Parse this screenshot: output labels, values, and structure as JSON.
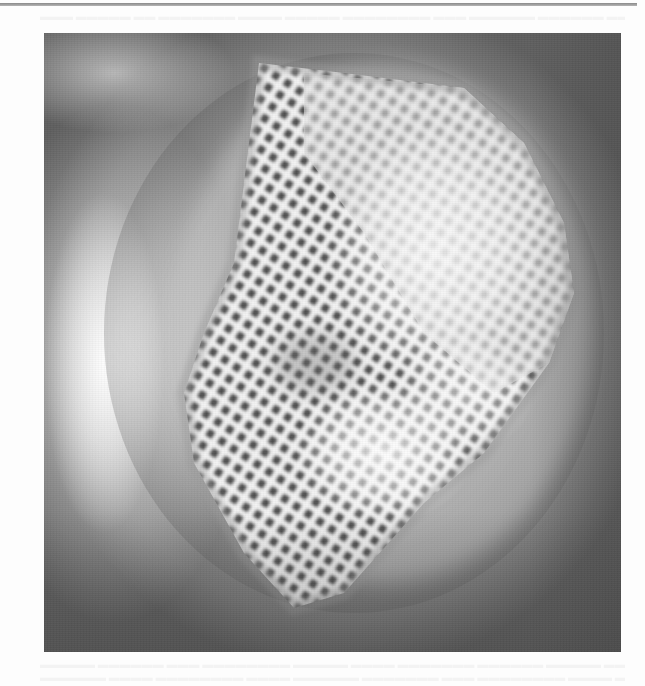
{
  "page": {
    "type": "scanned-document-page",
    "header_rule": true,
    "bleed_through_text": {
      "top_legible": false,
      "bottom_legible": false
    }
  },
  "figure": {
    "kind": "grayscale-photograph",
    "colors": {
      "background_gray": "#8a8a8a",
      "highlight": "#f4f4f4",
      "mesh_strand": "#f2f2f2",
      "mesh_hole": "#4a4a4a",
      "vignette_dark": "#5e5e5e"
    },
    "mesh": {
      "rotation_deg": 33,
      "cell_pitch_px": 14,
      "shape": "diamond patch"
    },
    "caption": ""
  }
}
